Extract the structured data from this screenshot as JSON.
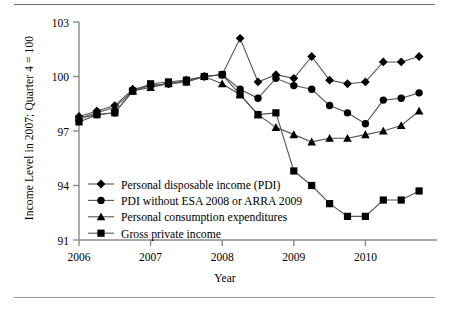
{
  "figure": {
    "y_axis_title": "Income Level in 2007; Quarter 4 = 100",
    "x_axis_title": "Year"
  },
  "chart_data": {
    "type": "line",
    "title": "",
    "xlabel": "Year",
    "ylabel": "Income Level in 2007; Quarter 4 = 100",
    "xlim": [
      2006.0,
      2011.0
    ],
    "ylim": [
      91,
      103
    ],
    "ytick_labels": [
      "91",
      "94",
      "97",
      "100",
      "103"
    ],
    "yticks": [
      91,
      94,
      97,
      100,
      103
    ],
    "xtick_labels": [
      "2006",
      "2007",
      "2008",
      "2009",
      "2010"
    ],
    "xticks": [
      2006,
      2007,
      2008,
      2009,
      2010
    ],
    "grid": false,
    "legend_position": "lower-left inside axes",
    "x": [
      2006.0,
      2006.25,
      2006.5,
      2006.75,
      2007.0,
      2007.25,
      2007.5,
      2007.75,
      2008.0,
      2008.25,
      2008.5,
      2008.75,
      2009.0,
      2009.25,
      2009.5,
      2009.75,
      2010.0,
      2010.25,
      2010.5,
      2010.75
    ],
    "series": [
      {
        "name": "Personal disposable income (PDI)",
        "marker": "diamond",
        "values": [
          97.8,
          98.1,
          98.4,
          99.3,
          99.5,
          99.6,
          99.8,
          100.0,
          100.1,
          102.1,
          99.7,
          100.1,
          99.9,
          101.1,
          99.8,
          99.6,
          99.7,
          100.8,
          100.8,
          101.1
        ]
      },
      {
        "name": "PDI without ESA 2008 or ARRA 2009",
        "marker": "circle",
        "values": [
          97.7,
          97.9,
          98.0,
          99.2,
          99.5,
          99.6,
          99.7,
          100.0,
          100.1,
          99.3,
          98.8,
          99.9,
          99.5,
          99.3,
          98.4,
          98.0,
          97.4,
          98.7,
          98.8,
          99.1
        ]
      },
      {
        "name": "Personal consumption expenditures",
        "marker": "triangle",
        "values": [
          97.7,
          98.0,
          98.3,
          99.2,
          99.4,
          99.6,
          99.7,
          100.0,
          99.6,
          99.0,
          97.9,
          97.2,
          96.8,
          96.4,
          96.6,
          96.6,
          96.8,
          97.0,
          97.3,
          98.1
        ]
      },
      {
        "name": "Gross private income",
        "marker": "square",
        "values": [
          97.5,
          97.9,
          98.0,
          99.2,
          99.6,
          99.7,
          99.8,
          100.0,
          100.1,
          99.0,
          97.9,
          98.0,
          94.8,
          94.0,
          93.0,
          92.3,
          92.3,
          93.2,
          93.2,
          93.7
        ]
      }
    ],
    "legend": [
      "Personal disposable income (PDI)",
      "PDI without ESA 2008 or ARRA 2009",
      "Personal consumption expenditures",
      "Gross private income"
    ],
    "colors": {
      "series_line": "#555555",
      "marker_fill": "#000000",
      "axis": "#8a8a8a",
      "background": "#ffffff"
    }
  }
}
